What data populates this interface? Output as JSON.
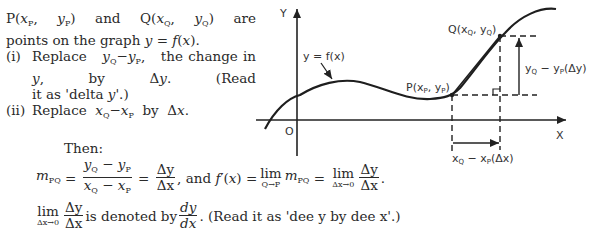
{
  "intro": {
    "line1": "P(xP, yP) and Q(xQ, yQ) are",
    "line2": "points on the graph y = f(x).",
    "items": [
      {
        "num": "(i)",
        "text": "Replace yQ − yP, the change in y, by Δy. (Read it as 'delta y'.)"
      },
      {
        "num": "(ii)",
        "text": "Replace xQ − xP by Δx."
      }
    ]
  },
  "derivation": {
    "then_label": "Then:",
    "m_pq": "m",
    "m_sub": "PQ",
    "frac1_num": "yQ − yP",
    "frac1_den": "xQ − xP",
    "frac2_num": "Δy",
    "frac2_den": "Δx",
    "and_text": ", and f′(x) =",
    "lim_word": "lim",
    "lim1_sub": "Q→P",
    "lim2_sub": "Δx→0",
    "limit_line_text": "is denoted by",
    "dy": "dy",
    "dx": "dx",
    "read_note": ". (Read it as 'dee y by dee x'.)"
  },
  "graph": {
    "axis_y_label": "Y",
    "axis_x_label": "X",
    "origin_label": "O",
    "curve_label": "y = f(x)",
    "point_p_label": "P(xP, yP)",
    "point_q_label": "Q(xQ, yQ)",
    "delta_y_label": "yQ − yP(Δy)",
    "delta_x_label": "xQ − xP(Δx)"
  }
}
